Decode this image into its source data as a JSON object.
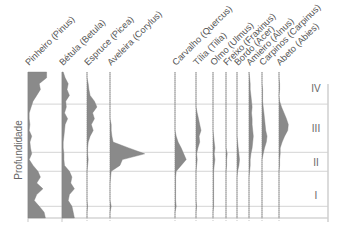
{
  "chart_data": {
    "type": "area",
    "title": "",
    "ylabel": "Profundidade",
    "xlabel": "",
    "y_direction": "depth increases downward",
    "depth_range": [
      0,
      100
    ],
    "zones": [
      {
        "label": "IV",
        "top": 0,
        "bottom": 22
      },
      {
        "label": "III",
        "top": 22,
        "bottom": 55
      },
      {
        "label": "II",
        "top": 55,
        "bottom": 68
      },
      {
        "label": "I",
        "top": 68,
        "bottom": 100
      }
    ],
    "extra_lines_depth": [
      92
    ],
    "samples_depth": [
      0,
      4,
      8,
      12,
      16,
      20,
      24,
      28,
      32,
      36,
      40,
      44,
      48,
      52,
      56,
      60,
      64,
      68,
      72,
      76,
      80,
      84,
      88,
      92,
      96,
      100
    ],
    "series": [
      {
        "name": "Pinheiro (Pinus)",
        "scale": 1.0,
        "values": [
          30,
          30,
          18,
          20,
          14,
          8,
          5,
          2,
          2,
          3,
          2,
          6,
          3,
          4,
          6,
          2,
          8,
          16,
          20,
          14,
          24,
          14,
          10,
          18,
          26,
          28
        ]
      },
      {
        "name": "Bétula (Betula)",
        "scale": 1.0,
        "values": [
          2,
          5,
          10,
          8,
          12,
          6,
          7,
          4,
          9,
          5,
          4,
          3,
          2,
          2,
          3,
          3,
          4,
          12,
          16,
          14,
          20,
          12,
          10,
          16,
          18,
          20
        ]
      },
      {
        "name": "Espruce (Picea)",
        "scale": 1.0,
        "values": [
          0,
          0,
          2,
          3,
          5,
          12,
          16,
          9,
          12,
          7,
          10,
          5,
          2,
          1,
          1,
          2,
          1,
          0,
          0,
          0,
          0,
          0,
          0,
          1,
          0,
          0
        ]
      },
      {
        "name": "Aveleira (Corylus)",
        "scale": 1.0,
        "values": [
          0,
          0,
          0,
          0,
          0,
          0,
          0,
          0,
          0,
          2,
          2,
          3,
          5,
          30,
          56,
          20,
          16,
          2,
          1,
          0,
          0,
          0,
          0,
          2,
          0,
          0
        ]
      },
      {
        "name": "Carvalho (Quercus)",
        "scale": 1.0,
        "values": [
          0,
          0,
          0,
          0,
          0,
          0,
          0,
          0,
          0,
          0,
          0,
          2,
          5,
          10,
          14,
          18,
          10,
          2,
          1,
          1,
          1,
          1,
          1,
          2,
          0,
          0
        ]
      },
      {
        "name": "Tília (Tilia)",
        "scale": 1.0,
        "values": [
          0,
          0,
          0,
          0,
          0,
          0,
          0,
          2,
          4,
          6,
          8,
          5,
          6,
          3,
          1,
          2,
          1,
          0,
          0,
          0,
          0,
          0,
          0,
          1,
          0,
          0
        ]
      },
      {
        "name": "Olmo (Ulmus)",
        "scale": 1.0,
        "values": [
          0,
          0,
          0,
          0,
          0,
          0,
          0,
          0,
          0,
          0,
          0,
          1,
          2,
          3,
          2,
          3,
          2,
          1,
          1,
          1,
          1,
          1,
          1,
          1,
          0,
          0
        ]
      },
      {
        "name": "Freixo (Fraxinus)",
        "scale": 1.0,
        "values": [
          0,
          0,
          0,
          0,
          0,
          0,
          0,
          0,
          0,
          0,
          0,
          0,
          0,
          0,
          2,
          1,
          1,
          0,
          0,
          0,
          0,
          0,
          0,
          0,
          0,
          0
        ]
      },
      {
        "name": "Bordo (Acer)",
        "scale": 1.0,
        "values": [
          0,
          0,
          0,
          0,
          0,
          0,
          0,
          0,
          0,
          0,
          0,
          0,
          1,
          2,
          3,
          4,
          3,
          1,
          0,
          0,
          0,
          0,
          0,
          0,
          0,
          0
        ]
      },
      {
        "name": "Amieiro (Alnus)",
        "scale": 1.0,
        "values": [
          0,
          1,
          2,
          2,
          3,
          4,
          5,
          4,
          5,
          5,
          6,
          7,
          6,
          5,
          3,
          2,
          2,
          1,
          0,
          0,
          0,
          0,
          0,
          0,
          0,
          0
        ]
      },
      {
        "name": "Carpinos (Carpinus)",
        "scale": 1.0,
        "values": [
          0,
          0,
          0,
          1,
          1,
          1,
          2,
          3,
          4,
          5,
          6,
          8,
          7,
          4,
          2,
          0,
          0,
          0,
          0,
          0,
          0,
          0,
          0,
          0,
          0,
          0
        ]
      },
      {
        "name": "Abeto (Abies)",
        "scale": 1.0,
        "values": [
          0,
          0,
          1,
          1,
          0,
          1,
          4,
          8,
          12,
          15,
          14,
          9,
          5,
          2,
          2,
          1,
          1,
          0,
          0,
          0,
          0,
          0,
          0,
          0,
          0,
          0
        ]
      }
    ],
    "legend": "none",
    "grid": false
  }
}
